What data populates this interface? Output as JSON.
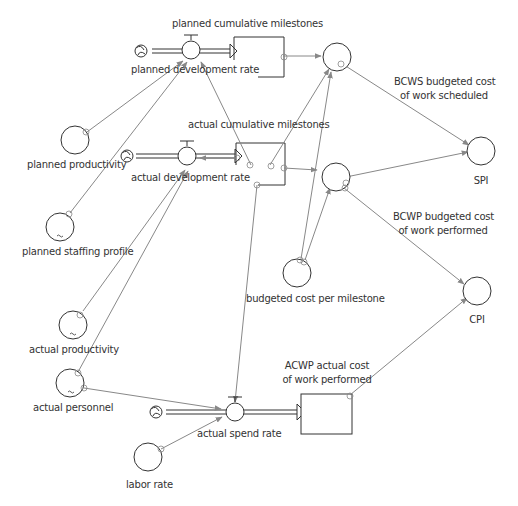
{
  "diagram": {
    "type": "stock-and-flow",
    "colors": {
      "stroke": "#333333",
      "link": "#888888",
      "arrowhead": "#888888",
      "background": "#ffffff"
    },
    "stocks": [
      {
        "id": "planned_cum",
        "label": "planned cumulative milestones"
      },
      {
        "id": "actual_cum",
        "label": "actual cumulative milestones"
      },
      {
        "id": "acwp",
        "label_line1": "ACWP actual cost",
        "label_line2": "of work performed"
      }
    ],
    "flows": [
      {
        "id": "planned_rate",
        "label": "planned development rate"
      },
      {
        "id": "actual_rate",
        "label": "actual development rate"
      },
      {
        "id": "spend_rate",
        "label": "actual spend rate"
      }
    ],
    "auxiliaries": [
      {
        "id": "planned_productivity",
        "label": "planned productivity"
      },
      {
        "id": "planned_staffing",
        "label": "planned staffing profile",
        "graphical": true
      },
      {
        "id": "actual_productivity",
        "label": "actual productivity",
        "graphical": true
      },
      {
        "id": "actual_personnel",
        "label": "actual personnel",
        "graphical": true
      },
      {
        "id": "labor_rate",
        "label": "labor rate"
      },
      {
        "id": "budgeted_cost",
        "label": "budgeted cost per milestone"
      },
      {
        "id": "bcws",
        "label_line1": "BCWS budgeted cost",
        "label_line2": "of work scheduled"
      },
      {
        "id": "bcwp",
        "label_line1": "BCWP budgeted cost",
        "label_line2": "of work performed"
      },
      {
        "id": "spi",
        "label": "SPI"
      },
      {
        "id": "cpi",
        "label": "CPI"
      }
    ]
  }
}
